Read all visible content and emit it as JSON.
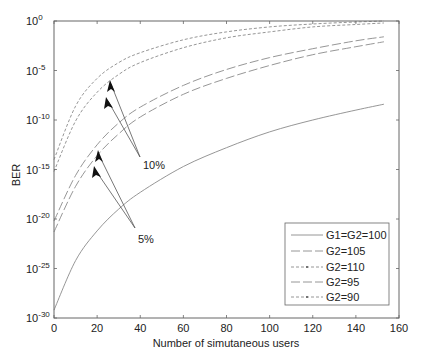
{
  "chart_data": {
    "type": "line",
    "title": "",
    "xlabel": "Number of simutaneous users",
    "ylabel": "BER",
    "xlim": [
      0,
      160
    ],
    "ylim_log10": [
      -30,
      0
    ],
    "yscale": "log",
    "grid": false,
    "legend_position": "lower right",
    "x_ticks": [
      "0",
      "20",
      "40",
      "60",
      "80",
      "100",
      "120",
      "140",
      "160"
    ],
    "y_ticks": [
      {
        "base": "10",
        "exp": "0"
      },
      {
        "base": "10",
        "exp": "-5"
      },
      {
        "base": "10",
        "exp": "-10"
      },
      {
        "base": "10",
        "exp": "-15"
      },
      {
        "base": "10",
        "exp": "-20"
      },
      {
        "base": "10",
        "exp": "-25"
      },
      {
        "base": "10",
        "exp": "-30"
      }
    ],
    "x": [
      0,
      10,
      20,
      30,
      40,
      60,
      80,
      100,
      120,
      140,
      153
    ],
    "series": [
      {
        "name": "G1=G2=100",
        "style": "solid",
        "log10_values": [
          -29.2,
          -24.2,
          -21.2,
          -19.0,
          -17.3,
          -14.7,
          -12.8,
          -11.2,
          -10.0,
          -9.0,
          -8.4
        ]
      },
      {
        "name": "G2=105",
        "style": "longdash",
        "log10_values": [
          -21.3,
          -16.7,
          -13.6,
          -11.4,
          -9.7,
          -7.4,
          -5.8,
          -4.5,
          -3.4,
          -2.6,
          -2.1
        ]
      },
      {
        "name": "G2=110",
        "style": "shortdash",
        "log10_values": [
          -15.2,
          -10.1,
          -7.2,
          -5.4,
          -4.2,
          -2.7,
          -1.7,
          -1.1,
          -0.6,
          -0.35,
          -0.2
        ]
      },
      {
        "name": "G2=95",
        "style": "longdash",
        "log10_values": [
          -20.2,
          -15.6,
          -12.5,
          -10.3,
          -8.7,
          -6.5,
          -4.9,
          -3.7,
          -2.8,
          -2.0,
          -1.6
        ]
      },
      {
        "name": "G2=90",
        "style": "shortdash",
        "log10_values": [
          -14.0,
          -8.6,
          -5.8,
          -4.2,
          -3.2,
          -1.9,
          -1.1,
          -0.6,
          -0.3,
          -0.1,
          0.0
        ]
      }
    ],
    "annotations": [
      {
        "text": "10%",
        "arrows_to": [
          "G2=90",
          "G2=110"
        ]
      },
      {
        "text": "5%",
        "arrows_to": [
          "G2=95",
          "G2=105"
        ]
      }
    ]
  },
  "labels": {
    "xlabel": "Number of simutaneous users",
    "ylabel": "BER",
    "annot_10": "10%",
    "annot_5": "5%"
  },
  "legend": [
    {
      "label": "G1=G2=100"
    },
    {
      "label": "G2=105"
    },
    {
      "label": "G2=110"
    },
    {
      "label": "G2=95"
    },
    {
      "label": "G2=90"
    }
  ],
  "colors": {
    "axis": "#555555",
    "line": "#8a8a8a",
    "arrow": "#111111",
    "text": "#222222"
  }
}
